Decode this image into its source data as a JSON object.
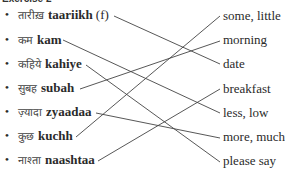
{
  "header": {
    "title": "Exercise 2"
  },
  "left_items": [
    {
      "hindi": "तारीख़",
      "translit": "taariikh",
      "gender": "(f)"
    },
    {
      "hindi": "कम",
      "translit": "kam",
      "gender": ""
    },
    {
      "hindi": "कहिये",
      "translit": "kahiye",
      "gender": ""
    },
    {
      "hindi": "सुबह",
      "translit": "subah",
      "gender": ""
    },
    {
      "hindi": "ज़्यादा",
      "translit": "zyaadaa",
      "gender": ""
    },
    {
      "hindi": "कुछ",
      "translit": "kuchh",
      "gender": ""
    },
    {
      "hindi": "नाश्ता",
      "translit": "naashtaa",
      "gender": ""
    }
  ],
  "right_items": [
    {
      "label": "some, little"
    },
    {
      "label": "morning"
    },
    {
      "label": "date"
    },
    {
      "label": "breakfast"
    },
    {
      "label": "less, low"
    },
    {
      "label": "more, much"
    },
    {
      "label": "please say"
    }
  ],
  "connections": [
    {
      "from": "taariikh",
      "to": "date"
    },
    {
      "from": "kam",
      "to": "less, low"
    },
    {
      "from": "kahiye",
      "to": "please say"
    },
    {
      "from": "subah",
      "to": "morning"
    },
    {
      "from": "zyaadaa",
      "to": "more, much"
    },
    {
      "from": "kuchh",
      "to": "some, little"
    },
    {
      "from": "naashtaa",
      "to": "breakfast"
    }
  ],
  "colors": {
    "text": "#2a2a2a",
    "line": "#444444",
    "background": "#ffffff"
  }
}
